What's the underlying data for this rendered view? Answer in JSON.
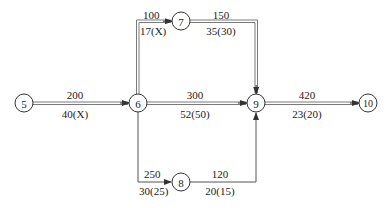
{
  "diagram": {
    "type": "activity-network",
    "colors": {
      "line": "#7a7a7a",
      "node_stroke": "#333333",
      "text": "#222222"
    },
    "nodes": [
      {
        "id": "5",
        "label": "5"
      },
      {
        "id": "6",
        "label": "6"
      },
      {
        "id": "7",
        "label": "7"
      },
      {
        "id": "8",
        "label": "8"
      },
      {
        "id": "9",
        "label": "9"
      },
      {
        "id": "10",
        "label": "10"
      }
    ],
    "edges": [
      {
        "from": "5",
        "to": "6",
        "cost": "200",
        "time": "40(X)",
        "critical": true
      },
      {
        "from": "6",
        "to": "7",
        "cost": "100",
        "time": "17(X)",
        "critical": true
      },
      {
        "from": "7",
        "to": "9",
        "cost": "150",
        "time": "35(30)",
        "critical": true
      },
      {
        "from": "6",
        "to": "9",
        "cost": "300",
        "time": "52(50)",
        "critical": true
      },
      {
        "from": "6",
        "to": "8",
        "cost": "250",
        "time": "30(25)",
        "critical": false
      },
      {
        "from": "8",
        "to": "9",
        "cost": "120",
        "time": "20(15)",
        "critical": false
      },
      {
        "from": "9",
        "to": "10",
        "cost": "420",
        "time": "23(20)",
        "critical": true
      }
    ]
  }
}
